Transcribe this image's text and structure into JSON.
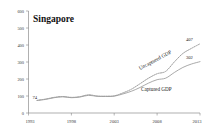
{
  "chart_data": {
    "type": "line",
    "title": "Singapore",
    "xlabel": "",
    "ylabel": "",
    "xlim": [
      1993,
      2013
    ],
    "ylim": [
      0,
      600
    ],
    "grid": false,
    "legend": "inline-annotations",
    "x_ticks": [
      "1993",
      "1998",
      "2003",
      "2008",
      "2013"
    ],
    "y_ticks": [
      "0",
      "100",
      "200",
      "300",
      "400",
      "500",
      "600"
    ],
    "x": [
      1994,
      1995,
      1996,
      1997,
      1998,
      1999,
      2000,
      2001,
      2002,
      2003,
      2004,
      2005,
      2006,
      2007,
      2008,
      2009,
      2010,
      2011,
      2012,
      2013
    ],
    "series": [
      {
        "name": "Uncaptured GDP",
        "style": "dotted",
        "values": [
          74,
          82,
          92,
          97,
          92,
          96,
          107,
          100,
          99,
          101,
          118,
          140,
          172,
          205,
          231,
          245,
          300,
          350,
          380,
          407
        ]
      },
      {
        "name": "Captured GDP",
        "style": "solid",
        "values": [
          74,
          80,
          90,
          95,
          90,
          94,
          104,
          98,
          97,
          99,
          112,
          128,
          150,
          176,
          196,
          205,
          238,
          268,
          288,
          302
        ]
      }
    ],
    "annotations": [
      {
        "id": "start-value",
        "text": "74",
        "x": 1994,
        "y": 74
      },
      {
        "id": "uncaptured-end-value",
        "text": "407",
        "x": 2013,
        "y": 407
      },
      {
        "id": "captured-end-value",
        "text": "302",
        "x": 2013,
        "y": 302
      },
      {
        "id": "uncaptured-series-label",
        "text": "Uncaptured GDP"
      },
      {
        "id": "captured-series-label",
        "text": "Captured GDP"
      }
    ]
  }
}
